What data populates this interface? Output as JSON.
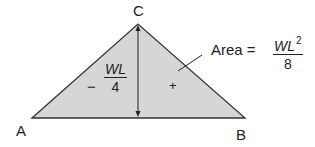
{
  "diagram": {
    "vertices": {
      "A": "A",
      "B": "B",
      "C": "C"
    },
    "left_moment": {
      "sign": "−",
      "numerator": "WL",
      "denominator": "4"
    },
    "area_sign": "+",
    "area_label": {
      "text": "Area =",
      "numerator": "WL",
      "exponent": "2",
      "denominator": "8"
    },
    "colors": {
      "fill": "#d6d6d6",
      "stroke": "#333333"
    }
  }
}
